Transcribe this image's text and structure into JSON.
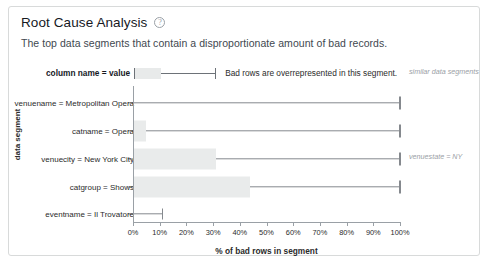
{
  "card": {
    "title": "Root Cause Analysis",
    "help_icon": "question-circle-icon",
    "subtitle": "The top data segments that contain a disproportionate amount of bad records."
  },
  "legend": {
    "key_label": "column name = value",
    "description": "Bad rows are overrepresented in this segment.",
    "similar_note": "similar data segments"
  },
  "annotations": {
    "right_segment": "venuestate = NY"
  },
  "chart_data": {
    "type": "bar",
    "title": "Root Cause Analysis",
    "subtitle": "The top data segments that contain a disproportionate amount of bad records.",
    "xlabel": "% of bad rows in segment",
    "ylabel": "data segment",
    "xlim": [
      0,
      100
    ],
    "grid": false,
    "legend_position": "top",
    "orientation": "horizontal",
    "tick_labels": [
      "0%",
      "10%",
      "20%",
      "30%",
      "40%",
      "50%",
      "60%",
      "70%",
      "80%",
      "90%",
      "100%"
    ],
    "tick_values": [
      0,
      10,
      20,
      30,
      40,
      50,
      60,
      70,
      80,
      90,
      100
    ],
    "categories": [
      "venuename = Metropolitan Opera",
      "catname = Opera",
      "venuecity = New York City",
      "catgroup = Shows",
      "eventname = Il Trovatore"
    ],
    "series": [
      {
        "name": "segment box (bad-row share range)",
        "values": [
          0,
          5,
          31,
          44,
          0
        ]
      },
      {
        "name": "whisker end (% of bad rows in segment)",
        "values": [
          100,
          100,
          100,
          100,
          11
        ]
      }
    ],
    "rows": [
      {
        "label": "venuename = Metropolitan Opera",
        "box_start": 0,
        "box_end": 0,
        "whisker_start": 0,
        "whisker_end": 100
      },
      {
        "label": "catname = Opera",
        "box_start": 0,
        "box_end": 5,
        "whisker_start": 5,
        "whisker_end": 100
      },
      {
        "label": "venuecity = New York City",
        "box_start": 0,
        "box_end": 31,
        "whisker_start": 31,
        "whisker_end": 100
      },
      {
        "label": "catgroup = Shows",
        "box_start": 0,
        "box_end": 44,
        "whisker_start": 44,
        "whisker_end": 100
      },
      {
        "label": "eventname = Il Trovatore",
        "box_start": 0,
        "box_end": 0,
        "whisker_start": 0,
        "whisker_end": 11
      }
    ]
  }
}
